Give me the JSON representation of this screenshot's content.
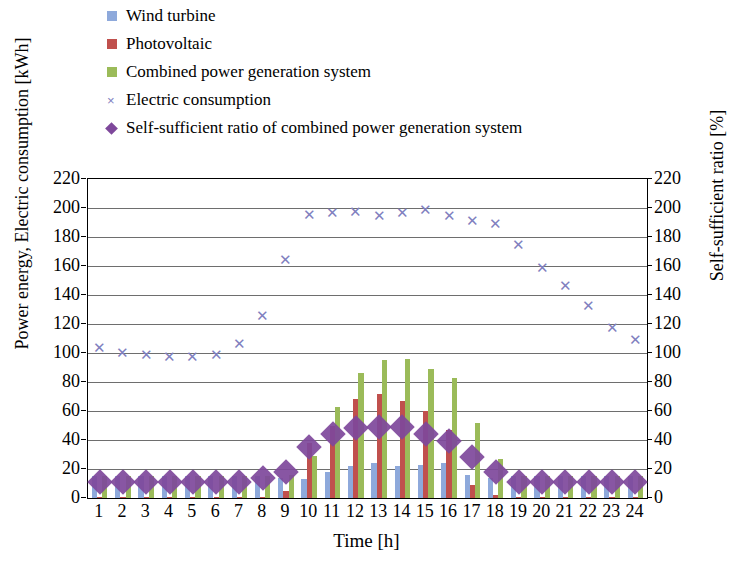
{
  "legend": {
    "items": [
      {
        "label": "Wind turbine",
        "marker": "square",
        "color": "#8EA9DB",
        "icon": "square-swatch-icon"
      },
      {
        "label": "Photovoltaic",
        "marker": "square",
        "color": "#C0504D",
        "icon": "square-swatch-icon"
      },
      {
        "label": "Combined power generation system",
        "marker": "square",
        "color": "#9BBB59",
        "icon": "square-swatch-icon"
      },
      {
        "label": "Electric consumption",
        "marker": "cross",
        "color": "#8080C0",
        "icon": "cross-marker-icon"
      },
      {
        "label": "Self-sufficient ratio of combined power generation system",
        "marker": "diamond",
        "color": "#7E489B",
        "icon": "diamond-marker-icon"
      }
    ]
  },
  "chart_data": {
    "type": "bar",
    "title": "",
    "xlabel": "Time [h]",
    "ylabel": "Power energy, Electric consumption [kWh]",
    "y2label": "Self-sufficient ratio [%]",
    "ylim": [
      0,
      220
    ],
    "y2lim": [
      0,
      220
    ],
    "grid": true,
    "legend_position": "top-left",
    "categories": [
      "1",
      "2",
      "3",
      "4",
      "5",
      "6",
      "7",
      "8",
      "9",
      "10",
      "11",
      "12",
      "13",
      "14",
      "15",
      "16",
      "17",
      "18",
      "19",
      "20",
      "21",
      "22",
      "23",
      "24"
    ],
    "yticks": [
      0,
      20,
      40,
      60,
      80,
      100,
      120,
      140,
      160,
      180,
      200,
      220
    ],
    "y2ticks": [
      0,
      20,
      40,
      60,
      80,
      100,
      120,
      140,
      160,
      180,
      200,
      220
    ],
    "series": [
      {
        "name": "Wind turbine",
        "type": "bar",
        "axis": "left",
        "unit": "kWh",
        "color": "#8EA9DB",
        "values": [
          15,
          15,
          15,
          15,
          15,
          15,
          15,
          15,
          14,
          13,
          18,
          22,
          24,
          22,
          23,
          24,
          16,
          14,
          15,
          15,
          15,
          15,
          15,
          15
        ]
      },
      {
        "name": "Photovoltaic",
        "type": "bar",
        "axis": "left",
        "unit": "kWh",
        "color": "#C0504D",
        "values": [
          1,
          1,
          1,
          1,
          1,
          1,
          1,
          1,
          5,
          38,
          50,
          68,
          72,
          67,
          60,
          47,
          9,
          2,
          1,
          1,
          1,
          1,
          1,
          1
        ]
      },
      {
        "name": "Combined power generation system",
        "type": "bar",
        "axis": "left",
        "unit": "kWh",
        "color": "#9BBB59",
        "values": [
          15,
          15,
          15,
          15,
          15,
          15,
          15,
          15,
          16,
          29,
          63,
          86,
          95,
          96,
          89,
          83,
          52,
          27,
          15,
          15,
          15,
          15,
          15,
          15
        ]
      },
      {
        "name": "Electric consumption",
        "type": "scatter",
        "axis": "left",
        "unit": "kWh",
        "color": "#8080C0",
        "values": [
          104,
          101,
          99,
          98,
          98,
          99,
          107,
          126,
          165,
          196,
          197,
          198,
          195,
          197,
          199,
          195,
          192,
          190,
          175,
          159,
          147,
          133,
          118,
          110
        ]
      },
      {
        "name": "Self-sufficient ratio of combined power generation system",
        "type": "scatter",
        "axis": "right",
        "unit": "%",
        "color": "#7E489B",
        "values": [
          11,
          11,
          11,
          11,
          11,
          11,
          11,
          14,
          18,
          35,
          44,
          48,
          49,
          49,
          44,
          39,
          28,
          18,
          11,
          11,
          11,
          11,
          11,
          11
        ]
      }
    ]
  }
}
